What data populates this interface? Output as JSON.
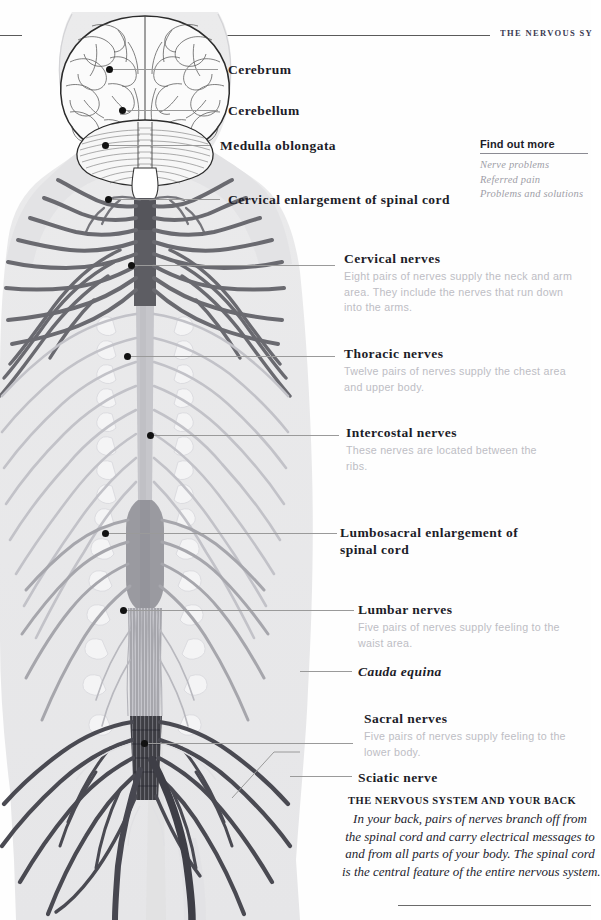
{
  "header": {
    "title": "THE NERVOUS SY"
  },
  "diagram": {
    "name": "human-nervous-system-posterior-view",
    "colors": {
      "body_silhouette": "#ededee",
      "cervical_cord": "#5d5d63",
      "thoracic_cord": "#c6c6cb",
      "lumbosacral_cord": "#9a9aa0",
      "sacrum": "#3e3e44",
      "nerve_dark": "#6a6a70",
      "nerve_light": "#c2c2c8",
      "leader_line": "#9a9a9a",
      "dot": "#111111"
    }
  },
  "labels": [
    {
      "id": "cerebrum",
      "title": "Cerebrum",
      "desc": ""
    },
    {
      "id": "cerebellum",
      "title": "Cerebellum",
      "desc": ""
    },
    {
      "id": "medulla",
      "title": "Medulla oblongata",
      "desc": ""
    },
    {
      "id": "cervical-enlargement",
      "title": "Cervical enlargement of spinal cord",
      "desc": ""
    },
    {
      "id": "cervical-nerves",
      "title": "Cervical nerves",
      "desc": "Eight pairs of nerves supply the neck and arm area. They include the nerves that run down into the arms."
    },
    {
      "id": "thoracic-nerves",
      "title": "Thoracic nerves",
      "desc": "Twelve pairs of nerves supply the chest area and upper body."
    },
    {
      "id": "intercostal-nerves",
      "title": "Intercostal nerves",
      "desc": "These nerves are located between the ribs."
    },
    {
      "id": "lumbosacral-enlargement",
      "title": "Lumbosacral enlargement of spinal cord",
      "desc": ""
    },
    {
      "id": "lumbar-nerves",
      "title": "Lumbar nerves",
      "desc": "Five pairs of nerves supply feeling to the waist area."
    },
    {
      "id": "cauda-equina",
      "title": "Cauda equina",
      "desc": ""
    },
    {
      "id": "sacral-nerves",
      "title": "Sacral nerves",
      "desc": "Five pairs of nerves supply feeling to the lower body."
    },
    {
      "id": "sciatic-nerve",
      "title": "Sciatic nerve",
      "desc": ""
    }
  ],
  "find_out_more": {
    "title": "Find out more",
    "items": [
      "Nerve problems",
      "Referred pain",
      "Problems and solutions"
    ]
  },
  "callout": {
    "title": "THE NERVOUS SYSTEM AND YOUR BACK",
    "lines": [
      "In your back, pairs of nerves branch off from",
      "the spinal cord and carry electrical messages to",
      "and from all parts of your body. The spinal cord",
      "is the central feature of the entire nervous system."
    ]
  }
}
